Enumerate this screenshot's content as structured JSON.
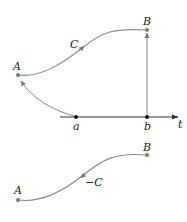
{
  "diagram": {
    "top": {
      "point_A_label": "A",
      "point_B_label": "B",
      "curve_label": "C",
      "axis_label": "t",
      "interval_start_label": "a",
      "interval_end_label": "b"
    },
    "bottom": {
      "point_A_label": "A",
      "point_B_label": "B",
      "curve_label": "−C"
    },
    "colors": {
      "curve": "#8a8a8a",
      "axis": "#333333",
      "points": "#7a7a7a",
      "axis_points": "#111111"
    }
  }
}
